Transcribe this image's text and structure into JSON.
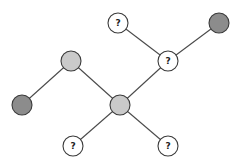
{
  "diagram": {
    "type": "tree-graph",
    "colors": {
      "dark": "#8c8c8c",
      "light": "#cacaca",
      "unknown": "#ffffff",
      "stroke": "#3a3a3a",
      "edge": "#4a4a4a"
    },
    "node_radius": 10,
    "nodes": [
      {
        "id": "n_top_q",
        "x": 118,
        "y": 23,
        "kind": "unknown",
        "label": "?"
      },
      {
        "id": "n_top_right_dark",
        "x": 219,
        "y": 23,
        "kind": "dark",
        "label": ""
      },
      {
        "id": "n_right_q",
        "x": 168,
        "y": 61,
        "kind": "unknown",
        "label": "?"
      },
      {
        "id": "n_left_light",
        "x": 71,
        "y": 61,
        "kind": "light",
        "label": ""
      },
      {
        "id": "n_far_left_dark",
        "x": 22,
        "y": 105,
        "kind": "dark",
        "label": ""
      },
      {
        "id": "n_center_light",
        "x": 120,
        "y": 105,
        "kind": "light",
        "label": ""
      },
      {
        "id": "n_bottom_left_q",
        "x": 73,
        "y": 146,
        "kind": "unknown",
        "label": "?"
      },
      {
        "id": "n_bottom_right_q",
        "x": 168,
        "y": 146,
        "kind": "unknown",
        "label": "?"
      }
    ],
    "edges": [
      {
        "from": "n_top_q",
        "to": "n_right_q"
      },
      {
        "from": "n_top_right_dark",
        "to": "n_right_q"
      },
      {
        "from": "n_right_q",
        "to": "n_center_light"
      },
      {
        "from": "n_left_light",
        "to": "n_center_light"
      },
      {
        "from": "n_left_light",
        "to": "n_far_left_dark"
      },
      {
        "from": "n_center_light",
        "to": "n_bottom_left_q"
      },
      {
        "from": "n_center_light",
        "to": "n_bottom_right_q"
      }
    ]
  }
}
